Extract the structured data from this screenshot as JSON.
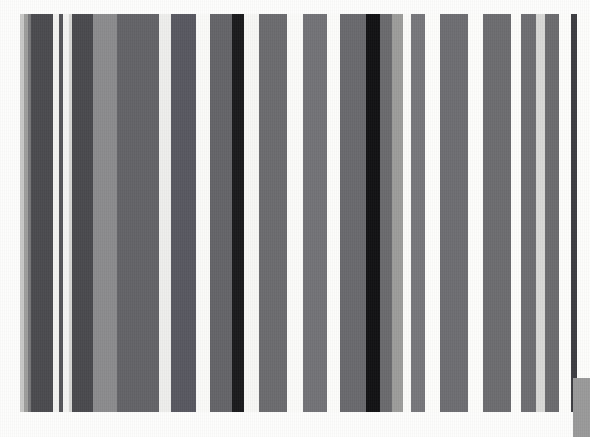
{
  "image": {
    "title": "Vertical stripe barcode pattern",
    "width": 590,
    "height": 437,
    "background_color": "#fdfdfc"
  },
  "stripes_region": {
    "top": 14,
    "height": 398,
    "left": 0,
    "width": 590
  },
  "corner_block": {
    "label": "bottom-right-gray-block",
    "x": 573,
    "y": 378,
    "width": 17,
    "height": 59,
    "color": "#9a9a9a"
  },
  "chart_data": {
    "type": "bar",
    "subtitle": "",
    "xlabel": "",
    "ylabel": "",
    "grid": false,
    "legend": "none",
    "orientation": "vertical",
    "background": "#fdfdfc",
    "note": "Full-height vertical bars of varying width and gray level, barcode-like",
    "x_unit": "pixels",
    "xlim": [
      0,
      590
    ],
    "ylim": [
      14,
      412
    ],
    "categories": [
      "b1",
      "b2",
      "b3",
      "b4",
      "b5",
      "b6",
      "b7",
      "b8",
      "b9",
      "b10",
      "b11",
      "b12",
      "b13",
      "b14",
      "b15",
      "b16",
      "b17",
      "b18",
      "b19",
      "b20",
      "b21",
      "b22",
      "b23",
      "b24",
      "b25",
      "b26",
      "b27",
      "b28",
      "b29",
      "b30",
      "b31",
      "b32",
      "b33",
      "b34",
      "b35",
      "b36",
      "b37",
      "b38",
      "b39",
      "b40",
      "b41",
      "b42",
      "b43"
    ],
    "bars": [
      {
        "x": 20,
        "width": 4,
        "color": "#c9c9c7"
      },
      {
        "x": 24,
        "width": 4,
        "color": "#9e9e9c"
      },
      {
        "x": 28,
        "width": 3,
        "color": "#78787a"
      },
      {
        "x": 31,
        "width": 22,
        "color": "#4b4b4f"
      },
      {
        "x": 53,
        "width": 6,
        "color": "#f2f2f0"
      },
      {
        "x": 59,
        "width": 4,
        "color": "#555559"
      },
      {
        "x": 63,
        "width": 6,
        "color": "#f4f4f2"
      },
      {
        "x": 69,
        "width": 3,
        "color": "#d6d6d4"
      },
      {
        "x": 72,
        "width": 21,
        "color": "#4a4a4e"
      },
      {
        "x": 93,
        "width": 24,
        "color": "#8b8b8d"
      },
      {
        "x": 117,
        "width": 42,
        "color": "#636367"
      },
      {
        "x": 159,
        "width": 12,
        "color": "#eeeeec"
      },
      {
        "x": 171,
        "width": 25,
        "color": "#585860"
      },
      {
        "x": 196,
        "width": 14,
        "color": "#fafaf8"
      },
      {
        "x": 210,
        "width": 22,
        "color": "#646468"
      },
      {
        "x": 232,
        "width": 12,
        "color": "#1a1a1c"
      },
      {
        "x": 244,
        "width": 15,
        "color": "#f7f7f5"
      },
      {
        "x": 259,
        "width": 28,
        "color": "#6b6b6f"
      },
      {
        "x": 287,
        "width": 16,
        "color": "#fbfbf9"
      },
      {
        "x": 303,
        "width": 24,
        "color": "#737377"
      },
      {
        "x": 327,
        "width": 13,
        "color": "#fcfcfa"
      },
      {
        "x": 340,
        "width": 26,
        "color": "#69696d"
      },
      {
        "x": 366,
        "width": 14,
        "color": "#121214"
      },
      {
        "x": 380,
        "width": 12,
        "color": "#6a6a6e"
      },
      {
        "x": 392,
        "width": 11,
        "color": "#9d9d9b"
      },
      {
        "x": 403,
        "width": 8,
        "color": "#fbfbf9"
      },
      {
        "x": 411,
        "width": 14,
        "color": "#77777b"
      },
      {
        "x": 425,
        "width": 15,
        "color": "#fdfdfb"
      },
      {
        "x": 440,
        "width": 28,
        "color": "#6e6e72"
      },
      {
        "x": 468,
        "width": 15,
        "color": "#fdfdfb"
      },
      {
        "x": 483,
        "width": 28,
        "color": "#6c6c70"
      },
      {
        "x": 511,
        "width": 10,
        "color": "#fdfdfb"
      },
      {
        "x": 521,
        "width": 15,
        "color": "#6e6e72"
      },
      {
        "x": 536,
        "width": 9,
        "color": "#d8d8d6"
      },
      {
        "x": 545,
        "width": 14,
        "color": "#6b6b6f"
      },
      {
        "x": 559,
        "width": 12,
        "color": "#fdfdfb"
      },
      {
        "x": 571,
        "width": 6,
        "color": "#3d3d41"
      },
      {
        "x": 577,
        "width": 13,
        "color": "#fdfdfb"
      },
      {
        "x": 590,
        "width": 0,
        "color": "#fdfdfb"
      },
      {
        "x": 590,
        "width": 0,
        "color": "#fdfdfb"
      },
      {
        "x": 590,
        "width": 0,
        "color": "#fdfdfb"
      },
      {
        "x": 590,
        "width": 0,
        "color": "#fdfdfb"
      },
      {
        "x": 590,
        "width": 0,
        "color": "#fdfdfb"
      }
    ],
    "values": [
      4,
      4,
      3,
      22,
      6,
      4,
      6,
      3,
      21,
      24,
      42,
      12,
      25,
      14,
      22,
      12,
      15,
      28,
      16,
      24,
      13,
      26,
      14,
      12,
      11,
      8,
      14,
      15,
      28,
      15,
      28,
      10,
      15,
      9,
      14,
      12,
      6,
      13,
      0,
      0,
      0,
      0,
      0
    ]
  }
}
